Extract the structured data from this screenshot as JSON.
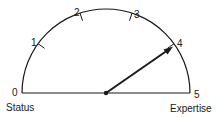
{
  "diagram": {
    "type": "semicircular-gauge",
    "center": [
      106,
      93
    ],
    "radius": 84,
    "ticks": [
      {
        "value": "0",
        "angle_deg": 180
      },
      {
        "value": "1",
        "angle_deg": 144
      },
      {
        "value": "2",
        "angle_deg": 108
      },
      {
        "value": "3",
        "angle_deg": 72
      },
      {
        "value": "4",
        "angle_deg": 36
      },
      {
        "value": "5",
        "angle_deg": 0
      }
    ],
    "needle": {
      "points_to": "4",
      "angle_deg": 35
    },
    "axis_labels": {
      "left": "Status",
      "right": "Expertise"
    },
    "colors": {
      "stroke": "#1a1a1a",
      "background": "#ffffff"
    }
  }
}
